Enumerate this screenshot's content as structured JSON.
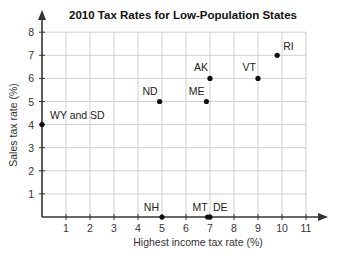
{
  "chart_data": {
    "type": "scatter",
    "title": "2010 Tax Rates for Low-Population States",
    "xlabel": "Highest income tax rate (%)",
    "ylabel": "Sales tax rate (%)",
    "xlim": [
      0,
      11
    ],
    "ylim": [
      0,
      8
    ],
    "x_ticks": [
      "1",
      "2",
      "3",
      "4",
      "5",
      "6",
      "7",
      "8",
      "9",
      "10",
      "11"
    ],
    "y_ticks": [
      "1",
      "2",
      "3",
      "4",
      "5",
      "6",
      "7",
      "8"
    ],
    "grid": true,
    "legend": null,
    "points": [
      {
        "label": "WY and SD",
        "x": 0,
        "y": 4,
        "label_dx": 8,
        "label_dy": -6,
        "anchor": "start"
      },
      {
        "label": "ND",
        "x": 4.9,
        "y": 5,
        "label_dx": -2,
        "label_dy": -7,
        "anchor": "end"
      },
      {
        "label": "ME",
        "x": 6.85,
        "y": 5,
        "label_dx": -2,
        "label_dy": -7,
        "anchor": "end"
      },
      {
        "label": "AK",
        "x": 7.0,
        "y": 6,
        "label_dx": -2,
        "label_dy": -7,
        "anchor": "end"
      },
      {
        "label": "VT",
        "x": 9.0,
        "y": 6,
        "label_dx": -2,
        "label_dy": -7,
        "anchor": "end"
      },
      {
        "label": "RI",
        "x": 9.8,
        "y": 7,
        "label_dx": 6,
        "label_dy": -5,
        "anchor": "start"
      },
      {
        "label": "NH",
        "x": 5.0,
        "y": 0,
        "label_dx": -3,
        "label_dy": -6,
        "anchor": "end"
      },
      {
        "label": "MT",
        "x": 6.9,
        "y": 0,
        "label_dx": 0,
        "label_dy": -6,
        "anchor": "end"
      },
      {
        "label": "DE",
        "x": 7.0,
        "y": 0,
        "label_dx": 3,
        "label_dy": -6,
        "anchor": "start"
      }
    ]
  },
  "colors": {
    "axis": "#333333",
    "grid": "#cfcfcf",
    "point": "#111111"
  }
}
